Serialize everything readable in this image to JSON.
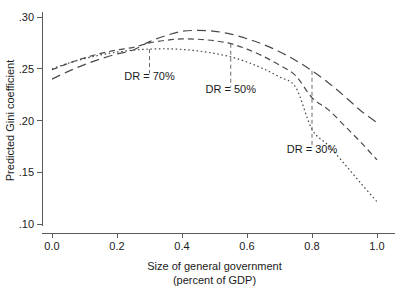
{
  "chart_data": {
    "type": "line",
    "title": "",
    "xlabel": "Size of general government",
    "xlabel_line2": "(percent of GDP)",
    "ylabel": "Predicted Gini coefficient",
    "xlim": [
      0.0,
      1.0
    ],
    "ylim": [
      0.1,
      0.3
    ],
    "grid": false,
    "legend": "none",
    "xticks": [
      "0.0",
      "0.2",
      "0.4",
      "0.6",
      "0.8",
      "1.0"
    ],
    "xtick_values": [
      0.0,
      0.2,
      0.4,
      0.6,
      0.8,
      1.0
    ],
    "yticks": [
      ".10",
      ".15",
      ".20",
      ".25",
      ".30"
    ],
    "ytick_values": [
      0.1,
      0.15,
      0.2,
      0.25,
      0.3
    ],
    "x": [
      0.0,
      0.05,
      0.1,
      0.15,
      0.2,
      0.25,
      0.3,
      0.35,
      0.4,
      0.45,
      0.5,
      0.55,
      0.6,
      0.65,
      0.7,
      0.75,
      0.8,
      0.85,
      0.9,
      0.95,
      1.0
    ],
    "series": [
      {
        "name": "DR = 70%",
        "style": "long-dash",
        "dasharray": "9 5",
        "values": [
          0.24,
          0.2475,
          0.254,
          0.2596,
          0.2643,
          0.2681,
          0.2762,
          0.282,
          0.2862,
          0.287,
          0.2862,
          0.2835,
          0.279,
          0.2735,
          0.2665,
          0.258,
          0.248,
          0.2365,
          0.2235,
          0.2095,
          0.198
        ]
      },
      {
        "name": "DR = 50%",
        "style": "medium-dash",
        "dasharray": "6 4",
        "values": [
          0.249,
          0.2552,
          0.2605,
          0.2648,
          0.2682,
          0.2707,
          0.275,
          0.2775,
          0.2788,
          0.2785,
          0.277,
          0.2742,
          0.269,
          0.262,
          0.2535,
          0.2432,
          0.222,
          0.2105,
          0.195,
          0.179,
          0.162
        ]
      },
      {
        "name": "DR = 30%",
        "style": "dotted",
        "dasharray": "1.6 2.6",
        "values": [
          0.25,
          0.2553,
          0.2598,
          0.2634,
          0.2661,
          0.268,
          0.269,
          0.2693,
          0.2687,
          0.2672,
          0.2648,
          0.2615,
          0.2565,
          0.25,
          0.242,
          0.232,
          0.1915,
          0.176,
          0.158,
          0.1395,
          0.1215
        ]
      }
    ],
    "annotations": [
      {
        "label": "DR = 70%",
        "x": 0.3,
        "curve_y": 0.269,
        "label_y": 0.2395,
        "leader_top": 0.269,
        "leader_bottom": 0.2455
      },
      {
        "label": "DR = 50%",
        "x": 0.55,
        "curve_y": 0.2742,
        "label_y": 0.2265,
        "leader_top": 0.2742,
        "leader_bottom": 0.2325
      },
      {
        "label": "DR = 30%",
        "x": 0.8,
        "curve_y": 0.248,
        "label_y": 0.1685,
        "leader_top": 0.248,
        "leader_bottom": 0.176
      }
    ]
  },
  "colors": {
    "background": "#ffffff",
    "axis": "#5a5a5a",
    "curve": "#4a4a4a",
    "leader": "#6a6a6a",
    "text": "#1a1a1a"
  }
}
